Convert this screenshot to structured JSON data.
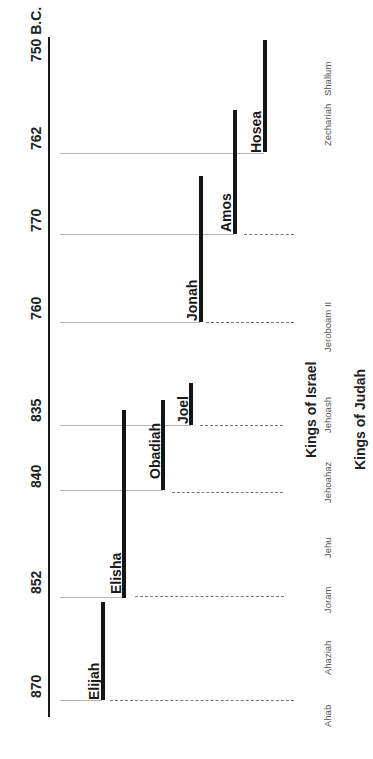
{
  "axis": {
    "years": [
      {
        "label": "750 B.C.",
        "y": 62
      },
      {
        "label": "762",
        "y": 150
      },
      {
        "label": "770",
        "y": 232
      },
      {
        "label": "760",
        "y": 320
      },
      {
        "label": "835",
        "y": 422
      },
      {
        "label": "840",
        "y": 488
      },
      {
        "label": "852",
        "y": 594
      },
      {
        "label": "870",
        "y": 698
      }
    ]
  },
  "prophets": [
    {
      "name": "Hosea",
      "x": 264,
      "top": 40,
      "bottom": 152
    },
    {
      "name": "Amos",
      "x": 234,
      "top": 110,
      "bottom": 234
    },
    {
      "name": "Jonah",
      "x": 200,
      "top": 176,
      "bottom": 322
    },
    {
      "name": "Joel",
      "x": 190,
      "top": 383,
      "bottom": 425
    },
    {
      "name": "Obadiah",
      "x": 162,
      "top": 400,
      "bottom": 490
    },
    {
      "name": "Elisha",
      "x": 123,
      "top": 410,
      "bottom": 598
    },
    {
      "name": "Elijah",
      "x": 102,
      "top": 602,
      "bottom": 700
    }
  ],
  "kings_of_israel": {
    "heading": "Kings of Israel",
    "kings": [
      {
        "name": "Zechariah",
        "y": 146
      },
      {
        "name": "Shallum",
        "y": 96
      },
      {
        "name": "Jeroboam II",
        "y": 352
      },
      {
        "name": "Jehoash",
        "y": 433
      },
      {
        "name": "Jehoahaz",
        "y": 503
      },
      {
        "name": "Jehu",
        "y": 558
      },
      {
        "name": "Joram",
        "y": 613
      },
      {
        "name": "Ahaziah",
        "y": 675
      },
      {
        "name": "Ahab",
        "y": 727
      }
    ]
  },
  "kings_of_judah": {
    "heading": "Kings of Judah"
  }
}
